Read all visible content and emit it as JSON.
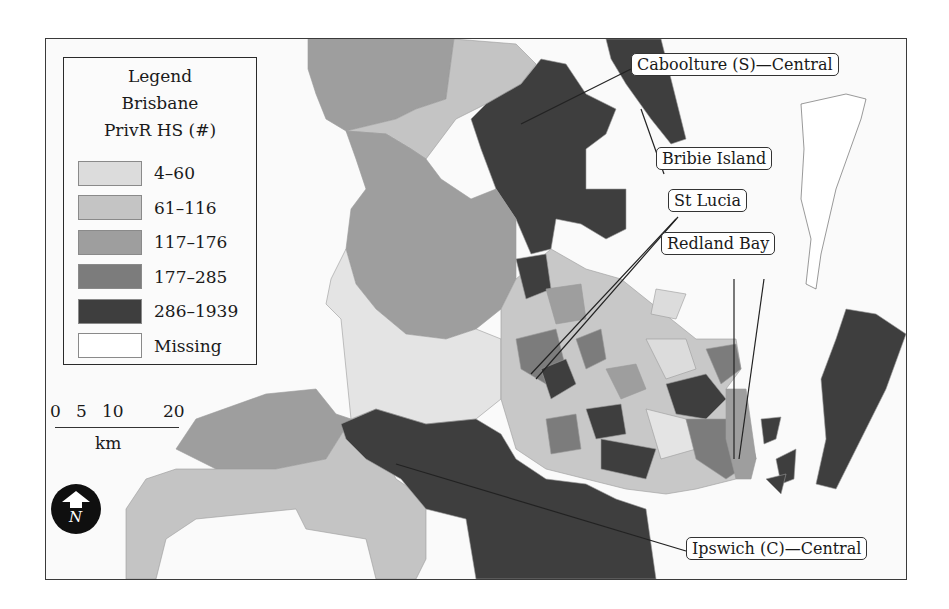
{
  "legend": {
    "title_lines": [
      "Legend",
      "Brisbane",
      "PrivR HS (#)"
    ],
    "items": [
      {
        "label": "4–60",
        "color": "#dcdcdc"
      },
      {
        "label": "61–116",
        "color": "#c4c4c4"
      },
      {
        "label": "117–176",
        "color": "#9e9e9e"
      },
      {
        "label": "177–285",
        "color": "#7c7c7c"
      },
      {
        "label": "286–1939",
        "color": "#3e3e3e"
      },
      {
        "label": "Missing",
        "color": "#ffffff"
      }
    ]
  },
  "scalebar": {
    "ticks": [
      "0",
      "5",
      "10",
      "20"
    ],
    "unit": "km"
  },
  "north_arrow": {
    "label": "N",
    "icon": "north-arrow-icon"
  },
  "callouts": [
    {
      "label": "Caboolture (S)—Central"
    },
    {
      "label": "Bribie Island"
    },
    {
      "label": "St Lucia"
    },
    {
      "label": "Redland Bay"
    },
    {
      "label": "Ipswich (C)—Central"
    }
  ]
}
